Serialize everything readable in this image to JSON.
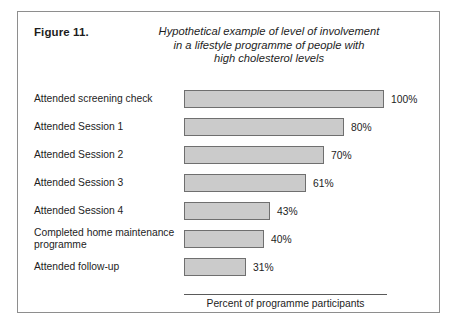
{
  "figure": {
    "number_label": "Figure 11.",
    "title_lines": [
      "Hypothetical example of level of involvement",
      "in a lifestyle programme of people with",
      "high cholesterol levels"
    ]
  },
  "colors": {
    "bar_fill": "#cbcbcb",
    "bar_border": "#6f6f6f",
    "frame_border": "#8e8e8e",
    "text": "#1d1d1d",
    "background": "#ffffff"
  },
  "chart_data": {
    "type": "bar",
    "orientation": "horizontal",
    "title": "Hypothetical example of level of involvement in a lifestyle programme of people with high cholesterol levels",
    "xlabel": "Percent of programme participants",
    "ylabel": "",
    "xlim": [
      0,
      100
    ],
    "grid": false,
    "legend": false,
    "tick_labels": [],
    "categories": [
      "Attended screening check",
      "Attended Session 1",
      "Attended Session 2",
      "Attended Session 3",
      "Attended Session 4",
      "Completed home maintenance programme",
      "Attended follow-up"
    ],
    "values": [
      100,
      80,
      70,
      61,
      43,
      40,
      31
    ],
    "value_labels": [
      "100%",
      "80%",
      "70%",
      "61%",
      "43%",
      "40%",
      "31%"
    ]
  },
  "rows": [
    {
      "label": "Attended screening check",
      "label_line2": "",
      "value": 100,
      "value_label": "100%"
    },
    {
      "label": "Attended Session 1",
      "label_line2": "",
      "value": 80,
      "value_label": "80%"
    },
    {
      "label": "Attended Session 2",
      "label_line2": "",
      "value": 70,
      "value_label": "70%"
    },
    {
      "label": "Attended Session 3",
      "label_line2": "",
      "value": 61,
      "value_label": "61%"
    },
    {
      "label": "Attended Session 4",
      "label_line2": "",
      "value": 43,
      "value_label": "43%"
    },
    {
      "label": "Completed home maintenance",
      "label_line2": "programme",
      "value": 40,
      "value_label": "40%"
    },
    {
      "label": "Attended follow-up",
      "label_line2": "",
      "value": 31,
      "value_label": "31%"
    }
  ],
  "axis": {
    "caption": "Percent of programme participants"
  }
}
